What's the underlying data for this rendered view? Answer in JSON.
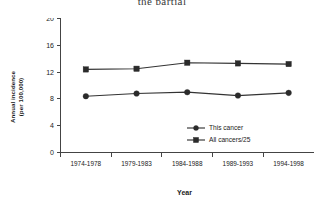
{
  "figure": {
    "title_fragment": "the partial",
    "background_color": "#ffffff",
    "line_color": "#333333",
    "marker_color": "#2b2b2b"
  },
  "axes": {
    "y_title_line1": "Annual incidence",
    "y_title_line2": "(per 100,000)",
    "x_title": "Year",
    "y_ticks": [
      "0",
      "4",
      "8",
      "12",
      "16",
      "20"
    ],
    "x_ticks": [
      "1974-1978",
      "1979-1983",
      "1984-1988",
      "1989-1993",
      "1994-1998"
    ]
  },
  "legend": {
    "items": [
      {
        "label": "This cancer",
        "marker": "circle"
      },
      {
        "label": "All cancers/25",
        "marker": "square"
      }
    ]
  },
  "chart_data": {
    "type": "line",
    "title": "",
    "xlabel": "Year",
    "ylabel": "Annual incidence (per 100,000)",
    "categories": [
      "1974-1978",
      "1979-1983",
      "1984-1988",
      "1989-1993",
      "1994-1998"
    ],
    "ylim": [
      0,
      20
    ],
    "yticks": [
      0,
      4,
      8,
      12,
      16,
      20
    ],
    "grid": false,
    "legend_position": "inside-lower-right",
    "series": [
      {
        "name": "This cancer",
        "marker": "circle",
        "values": [
          8.4,
          8.8,
          9.0,
          8.5,
          8.9
        ]
      },
      {
        "name": "All cancers/25",
        "marker": "square",
        "values": [
          12.4,
          12.5,
          13.4,
          13.3,
          13.2
        ]
      }
    ]
  }
}
